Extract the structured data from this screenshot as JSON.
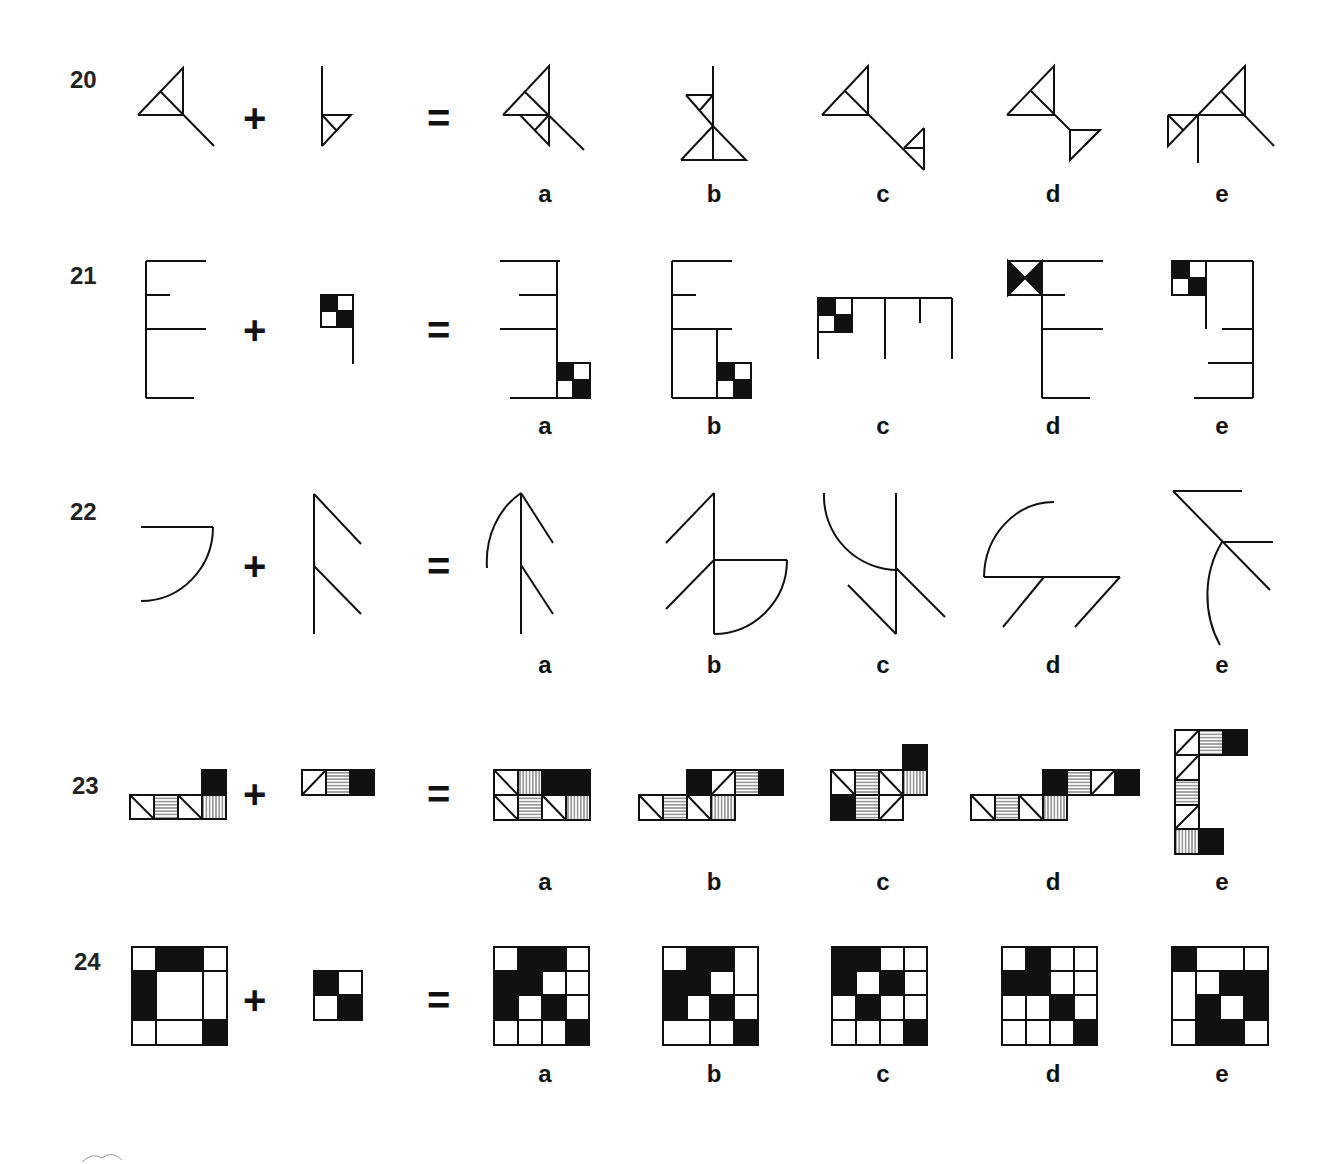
{
  "operators": {
    "plus": "+",
    "equals": "="
  },
  "option_labels": [
    "a",
    "b",
    "c",
    "d",
    "e"
  ],
  "questions": [
    {
      "number": "20",
      "figure_type": "line-triangles",
      "options": [
        "a",
        "b",
        "c",
        "d",
        "e"
      ]
    },
    {
      "number": "21",
      "figure_type": "comb-with-checker",
      "options": [
        "a",
        "b",
        "c",
        "d",
        "e"
      ]
    },
    {
      "number": "22",
      "figure_type": "arc-and-branches",
      "options": [
        "a",
        "b",
        "c",
        "d",
        "e"
      ]
    },
    {
      "number": "23",
      "figure_type": "patterned-tiles",
      "options": [
        "a",
        "b",
        "c",
        "d",
        "e"
      ]
    },
    {
      "number": "24",
      "figure_type": "grid-black-cells",
      "options": [
        "a",
        "b",
        "c",
        "d",
        "e"
      ]
    }
  ],
  "colors": {
    "ink": "#111111",
    "background": "#ffffff"
  }
}
